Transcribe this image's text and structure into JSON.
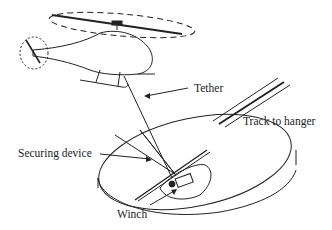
{
  "diagram": {
    "labels": {
      "tether": "Tether",
      "track": "Track to hanger",
      "securing": "Securing device",
      "winch": "Winch"
    },
    "colors": {
      "line": "#222222",
      "background": "#ffffff"
    }
  }
}
